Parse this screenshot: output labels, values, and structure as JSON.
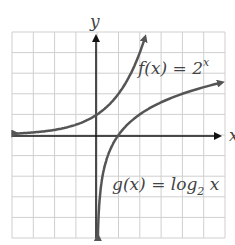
{
  "chart_data": {
    "type": "line",
    "title": "",
    "xlabel": "x",
    "ylabel": "y",
    "xlim": [
      -4,
      6
    ],
    "ylim": [
      -5,
      5
    ],
    "grid": true,
    "series": [
      {
        "name": "f(x) = 2^x",
        "label_main": "f(x) = 2",
        "label_sup": "x",
        "function": "2^x",
        "color": "#555555"
      },
      {
        "name": "g(x) = log2 x",
        "label_main": "g(x) = log",
        "label_sub": "2",
        "label_tail": " x",
        "function": "log2(x)",
        "color": "#555555"
      }
    ]
  },
  "axes": {
    "x_label": "x",
    "y_label": "y"
  },
  "labels": {
    "f_main": "f(x) = 2",
    "f_sup": "x",
    "g_main": "g(x) = log",
    "g_sub": "2",
    "g_tail": " x"
  }
}
